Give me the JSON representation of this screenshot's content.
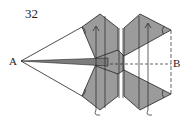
{
  "figure": {
    "step_number": "32",
    "point_labels": {
      "a": "A",
      "b": "B"
    },
    "colors": {
      "paper_shaded": "#9b9b9b",
      "line": "#222222",
      "background": "#ffffff"
    },
    "icons": [
      "fold-arrow-icon",
      "fold-arrow-icon",
      "valley-fold-line",
      "crease-line"
    ]
  }
}
